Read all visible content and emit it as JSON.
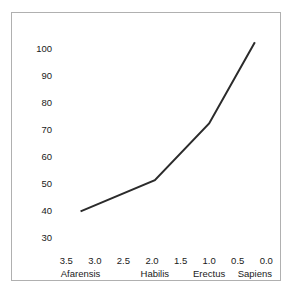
{
  "chart_data": {
    "type": "line",
    "title": "Brain size against age",
    "xlabel": "",
    "ylabel": "",
    "x": [
      3.25,
      1.95,
      1.0,
      0.2
    ],
    "values": [
      40,
      51.5,
      72.5,
      102.5
    ],
    "point_labels": [
      "Afarensis",
      "Habilis",
      "Erectus",
      "Sapiens"
    ],
    "xlim": [
      3.75,
      -0.1
    ],
    "ylim": [
      25,
      107
    ],
    "x_ticks": [
      "3.5",
      "3.0",
      "2.5",
      "2.0",
      "1.5",
      "1.0",
      "0.5",
      "0.0"
    ],
    "x_tick_values": [
      3.5,
      3.0,
      2.5,
      2.0,
      1.5,
      1.0,
      0.5,
      0.0
    ],
    "y_ticks": [
      "100",
      "90",
      "80",
      "70",
      "60",
      "50",
      "40",
      "30"
    ],
    "y_tick_values": [
      100,
      90,
      80,
      70,
      60,
      50,
      40,
      30
    ],
    "species_labels": [
      {
        "label": "Afarensis",
        "at": 3.25
      },
      {
        "label": "Habilis",
        "at": 1.95
      },
      {
        "label": "Erectus",
        "at": 1.0
      },
      {
        "label": "Sapiens",
        "at": 0.2
      }
    ],
    "grid": false,
    "legend": false,
    "line_color": "#2b2b2b",
    "line_width": 2,
    "frame_color": "#b0b0b0",
    "background_color": "#ffffff",
    "text_color": "#1a1a1a"
  }
}
